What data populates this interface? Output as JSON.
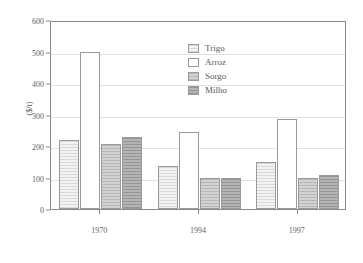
{
  "chart_data": {
    "type": "bar",
    "title": "",
    "subtitle": "",
    "xlabel": "",
    "ylabel": "($/t)",
    "categories": [
      "1970",
      "1994",
      "1997"
    ],
    "series": [
      {
        "name": "Trigo",
        "values": [
          220,
          135,
          148
        ],
        "color": "#f2f2f2"
      },
      {
        "name": "Arroz",
        "values": [
          500,
          245,
          285
        ],
        "color": "#ffffff"
      },
      {
        "name": "Sorgo",
        "values": [
          205,
          97,
          100
        ],
        "color": "#d2d2d2"
      },
      {
        "name": "Milho",
        "values": [
          230,
          100,
          108
        ],
        "color": "#b4b4b4"
      }
    ],
    "ylim": [
      0,
      600
    ],
    "yticks": [
      0,
      100,
      200,
      300,
      400,
      500,
      600
    ],
    "ytick_labels": [
      "0",
      "100",
      "200",
      "300",
      "400",
      "500",
      "600"
    ],
    "grid": true,
    "grid_axis": "y",
    "legend": true,
    "legend_position": "top-center",
    "legend_entries": [
      "Trigo",
      "Arroz",
      "Sorgo",
      "Milho"
    ],
    "frame_color": "#8a8a8a",
    "grid_color": "#e2e2e2",
    "text_color": "#606060"
  }
}
